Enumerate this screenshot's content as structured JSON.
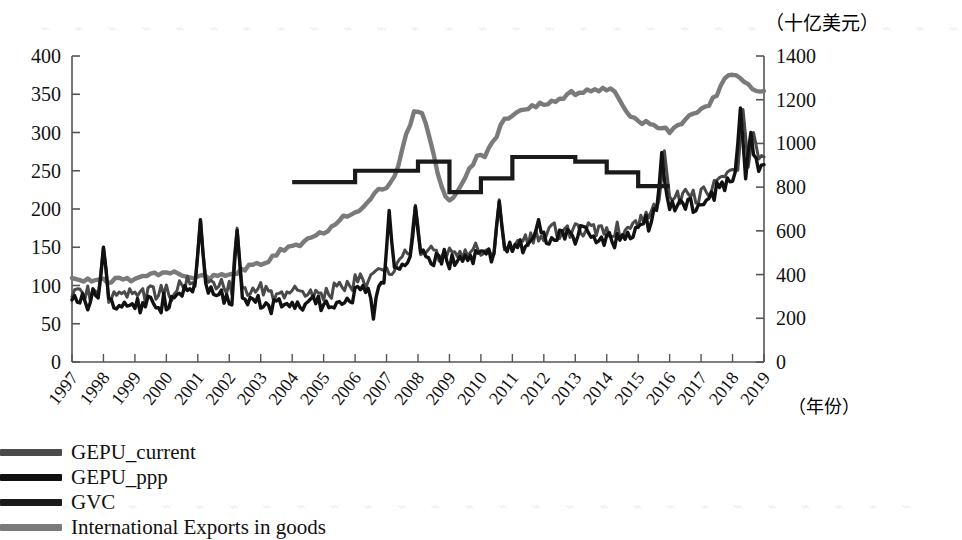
{
  "chart_data": {
    "type": "line",
    "title": "",
    "xlabel": "（年份）",
    "ylabel": "",
    "right_axis_unit": "（十亿美元）",
    "grid": false,
    "legend_position": "bottom",
    "x": [
      "1997",
      "1998",
      "1999",
      "2000",
      "2001",
      "2002",
      "2003",
      "2004",
      "2005",
      "2006",
      "2007",
      "2008",
      "2009",
      "2010",
      "2011",
      "2012",
      "2013",
      "2014",
      "2015",
      "2016",
      "2017",
      "2018",
      "2019"
    ],
    "xtick_labels": [
      "1997",
      "1998",
      "1999",
      "2000",
      "2001",
      "2002",
      "2003",
      "2004",
      "2005",
      "2006",
      "2007",
      "2008",
      "2009",
      "2010",
      "2011",
      "2012",
      "2013",
      "2014",
      "2015",
      "2016",
      "2017",
      "2018",
      "2019"
    ],
    "left_axis": {
      "ticks": [
        0,
        50,
        100,
        150,
        200,
        250,
        300,
        350,
        400
      ],
      "ylim": [
        0,
        400
      ]
    },
    "right_axis": {
      "ticks": [
        0,
        200,
        400,
        600,
        800,
        1000,
        1200,
        1400
      ],
      "ylim": [
        0,
        1400
      ]
    },
    "series": [
      {
        "name": "GEPU_current",
        "axis": "left",
        "color": "#4a4a4a",
        "note": "monthly index, overlaps closely with GEPU_ppp",
        "values_yearly": [
          92,
          88,
          86,
          90,
          104,
          96,
          93,
          88,
          92,
          104,
          118,
          150,
          140,
          144,
          152,
          166,
          176,
          168,
          180,
          216,
          218,
          250,
          268
        ]
      },
      {
        "name": "GEPU_ppp",
        "axis": "left",
        "color": "#111111",
        "values_yearly": [
          78,
          84,
          74,
          78,
          96,
          88,
          80,
          72,
          78,
          92,
          108,
          138,
          132,
          138,
          146,
          158,
          168,
          158,
          172,
          206,
          208,
          242,
          258
        ]
      },
      {
        "name": "GVC",
        "axis": "left",
        "color": "#1a1a1a",
        "style": "step",
        "x_range": [
          "2004",
          "2015"
        ],
        "steps": [
          {
            "year": "2004",
            "value": 235
          },
          {
            "year": "2005",
            "value": 235
          },
          {
            "year": "2006",
            "value": 250
          },
          {
            "year": "2007",
            "value": 250
          },
          {
            "year": "2008",
            "value": 262
          },
          {
            "year": "2009",
            "value": 222
          },
          {
            "year": "2010",
            "value": 240
          },
          {
            "year": "2011",
            "value": 268
          },
          {
            "year": "2012",
            "value": 268
          },
          {
            "year": "2013",
            "value": 262
          },
          {
            "year": "2014",
            "value": 248
          },
          {
            "year": "2015",
            "value": 230
          }
        ]
      },
      {
        "name": "International Exports in goods",
        "axis": "right",
        "color": "#7a7a7a",
        "values_yearly_billion_usd": [
          375,
          370,
          378,
          405,
          386,
          400,
          455,
          528,
          600,
          690,
          800,
          1150,
          745,
          940,
          1135,
          1185,
          1230,
          1250,
          1100,
          1060,
          1150,
          1310,
          1240
        ]
      }
    ],
    "annotations": []
  },
  "axes": {
    "left_ticks": [
      "400",
      "350",
      "300",
      "250",
      "200",
      "150",
      "100",
      "50",
      "0"
    ],
    "right_ticks": [
      "1400",
      "1200",
      "1000",
      "800",
      "600",
      "400",
      "200",
      "0"
    ],
    "x_ticks": [
      "1997",
      "1998",
      "1999",
      "2000",
      "2001",
      "2002",
      "2003",
      "2004",
      "2005",
      "2006",
      "2007",
      "2008",
      "2009",
      "2010",
      "2011",
      "2012",
      "2013",
      "2014",
      "2015",
      "2016",
      "2017",
      "2018",
      "2019"
    ],
    "right_unit_label": "（十亿美元）",
    "x_unit_label": "（年份）"
  },
  "legend": {
    "items": [
      {
        "label": "GEPU_current",
        "color": "#4a4a4a"
      },
      {
        "label": "GEPU_ppp",
        "color": "#111111"
      },
      {
        "label": "GVC",
        "color": "#1a1a1a"
      },
      {
        "label": "International Exports in goods",
        "color": "#7a7a7a"
      }
    ]
  },
  "colors": {
    "gepu_current": "#4a4a4a",
    "gepu_ppp": "#111111",
    "gvc": "#1a1a1a",
    "exports": "#7a7a7a",
    "axis": "#555555",
    "background": "#ffffff"
  }
}
